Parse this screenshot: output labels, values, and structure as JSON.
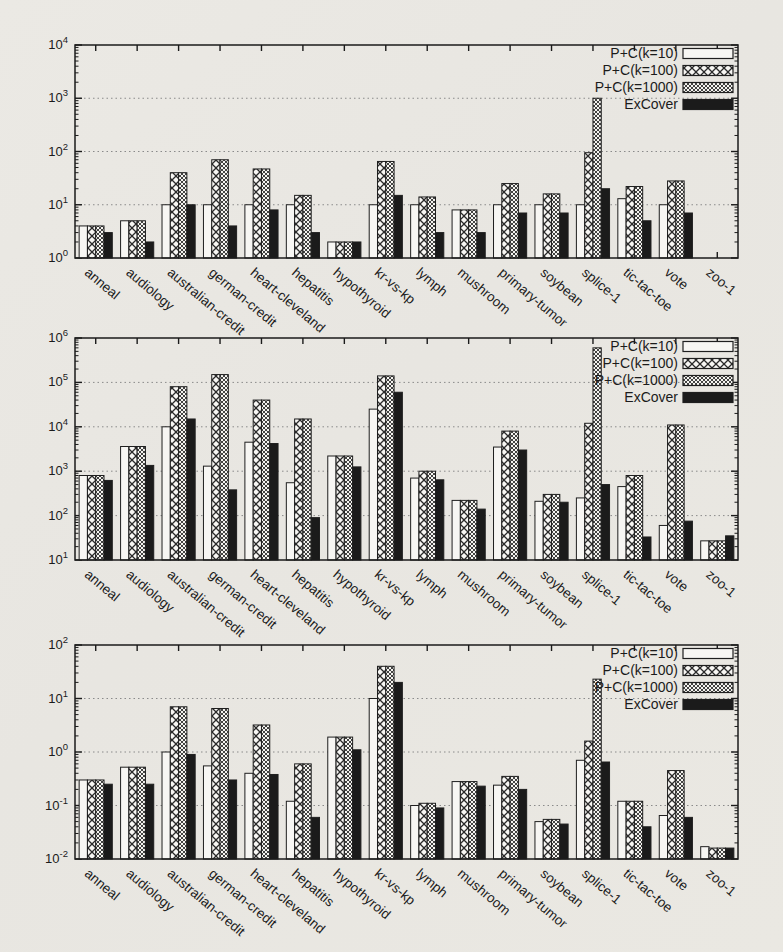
{
  "figure": {
    "description_visible_text_only": "",
    "colors": {
      "ink": "#1b1b1b",
      "grid": "#8a8a8a",
      "paper": "#e9e7e2",
      "bar_white": "#f7f6f3",
      "bar_black": "#1b1b1b"
    }
  },
  "legend": {
    "labels": [
      "P+C(k=10)",
      "P+C(k=100)",
      "P+C(k=1000)",
      "ExCover"
    ]
  },
  "chart_data": [
    {
      "type": "bar",
      "scale": "log-y",
      "title": "",
      "xlabel": "",
      "ylabel": "",
      "ylim": [
        1,
        10000
      ],
      "y_min_exp": 0,
      "y_max_exp": 4,
      "ytick_labels": [
        "10^0",
        "10^1",
        "10^2",
        "10^3",
        "10^4"
      ],
      "grid": "dotted horizontal major gridlines",
      "legend_position": "top-right-inside",
      "categories": [
        "anneal",
        "audiology",
        "australian-credit",
        "german-credit",
        "heart-cleveland",
        "hepatitis",
        "hypothyroid",
        "kr-vs-kp",
        "lymph",
        "mushroom",
        "primary-tumor",
        "soybean",
        "splice-1",
        "tic-tac-toe",
        "vote",
        "zoo-1"
      ],
      "series": [
        {
          "name": "P+C(k=10)",
          "swatch": "solid-white",
          "values": [
            4,
            5,
            10,
            10,
            10,
            10,
            2,
            10,
            10,
            8,
            10,
            10,
            10,
            13,
            10,
            1
          ]
        },
        {
          "name": "P+C(k=100)",
          "swatch": "crosshatch-coarse",
          "values": [
            4,
            5,
            40,
            70,
            47,
            15,
            2,
            65,
            14,
            8,
            25,
            16,
            95,
            22,
            28,
            1
          ]
        },
        {
          "name": "P+C(k=1000)",
          "swatch": "crosshatch-fine",
          "values": [
            4,
            5,
            40,
            70,
            47,
            15,
            2,
            65,
            14,
            8,
            25,
            16,
            1000,
            22,
            28,
            1
          ]
        },
        {
          "name": "ExCover",
          "swatch": "solid-black",
          "values": [
            3,
            2,
            10,
            4,
            8,
            3,
            2,
            15,
            3,
            3,
            7,
            7,
            20,
            5,
            7,
            1
          ]
        }
      ]
    },
    {
      "type": "bar",
      "scale": "log-y",
      "title": "",
      "xlabel": "",
      "ylabel": "",
      "ylim": [
        10,
        1000000
      ],
      "y_min_exp": 1,
      "y_max_exp": 6,
      "ytick_labels": [
        "10^1",
        "10^2",
        "10^3",
        "10^4",
        "10^5",
        "10^6"
      ],
      "grid": "dotted horizontal major gridlines",
      "legend_position": "top-right-inside",
      "categories": [
        "anneal",
        "audiology",
        "australian-credit",
        "german-credit",
        "heart-cleveland",
        "hepatitis",
        "hypothyroid",
        "kr-vs-kp",
        "lymph",
        "mushroom",
        "primary-tumor",
        "soybean",
        "splice-1",
        "tic-tac-toe",
        "vote",
        "zoo-1"
      ],
      "series": [
        {
          "name": "P+C(k=10)",
          "swatch": "solid-white",
          "values": [
            800,
            3600,
            10000,
            1300,
            4500,
            550,
            2200,
            25000,
            700,
            220,
            3500,
            210,
            250,
            450,
            60,
            27
          ]
        },
        {
          "name": "P+C(k=100)",
          "swatch": "crosshatch-coarse",
          "values": [
            800,
            3600,
            80000,
            150000,
            40000,
            15000,
            2200,
            140000,
            1000,
            220,
            8000,
            300,
            12000,
            800,
            11000,
            27
          ]
        },
        {
          "name": "P+C(k=1000)",
          "swatch": "crosshatch-fine",
          "values": [
            800,
            3600,
            80000,
            150000,
            40000,
            15000,
            2200,
            140000,
            1000,
            220,
            8000,
            300,
            600000,
            800,
            11000,
            27
          ]
        },
        {
          "name": "ExCover",
          "swatch": "solid-black",
          "values": [
            620,
            1350,
            15000,
            380,
            4200,
            90,
            1250,
            60000,
            640,
            140,
            3000,
            200,
            500,
            33,
            75,
            35
          ]
        }
      ]
    },
    {
      "type": "bar",
      "scale": "log-y",
      "title": "",
      "xlabel": "",
      "ylabel": "",
      "ylim": [
        0.01,
        100
      ],
      "y_min_exp": -2,
      "y_max_exp": 2,
      "ytick_labels": [
        "10^-2",
        "10^-1",
        "10^0",
        "10^1",
        "10^2"
      ],
      "grid": "dotted horizontal major gridlines",
      "legend_position": "top-right-inside",
      "categories": [
        "anneal",
        "audiology",
        "australian-credit",
        "german-credit",
        "heart-cleveland",
        "hepatitis",
        "hypothyroid",
        "kr-vs-kp",
        "lymph",
        "mushroom",
        "primary-tumor",
        "soybean",
        "splice-1",
        "tic-tac-toe",
        "vote",
        "zoo-1"
      ],
      "series": [
        {
          "name": "P+C(k=10)",
          "swatch": "solid-white",
          "values": [
            0.3,
            0.52,
            1.0,
            0.55,
            0.4,
            0.12,
            1.9,
            10,
            0.1,
            0.28,
            0.24,
            0.05,
            0.7,
            0.12,
            0.065,
            0.017
          ]
        },
        {
          "name": "P+C(k=100)",
          "swatch": "crosshatch-coarse",
          "values": [
            0.3,
            0.52,
            7,
            6.5,
            3.2,
            0.6,
            1.9,
            40,
            0.11,
            0.28,
            0.35,
            0.055,
            1.6,
            0.12,
            0.45,
            0.016
          ]
        },
        {
          "name": "P+C(k=1000)",
          "swatch": "crosshatch-fine",
          "values": [
            0.3,
            0.52,
            7,
            6.5,
            3.2,
            0.6,
            1.9,
            40,
            0.11,
            0.28,
            0.35,
            0.055,
            23,
            0.12,
            0.45,
            0.016
          ]
        },
        {
          "name": "ExCover",
          "swatch": "solid-black",
          "values": [
            0.25,
            0.25,
            0.9,
            0.3,
            0.38,
            0.06,
            1.1,
            20,
            0.09,
            0.23,
            0.2,
            0.045,
            0.65,
            0.04,
            0.06,
            0.016
          ]
        }
      ]
    }
  ]
}
